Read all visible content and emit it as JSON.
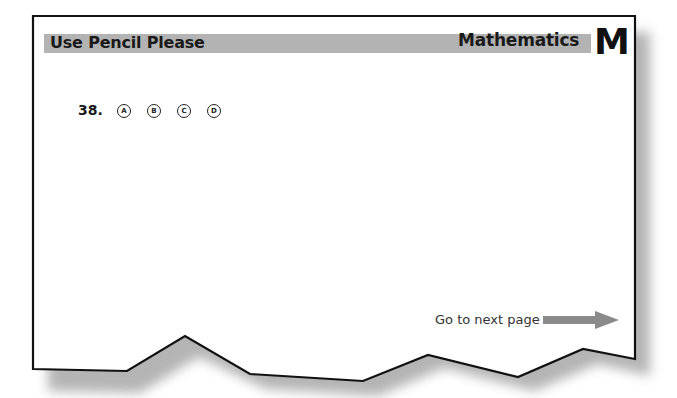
{
  "header": {
    "left_title": "Use Pencil Please",
    "right_title": "Mathematics",
    "section_letter": "M"
  },
  "question": {
    "number": "38.",
    "options": [
      "A",
      "B",
      "C",
      "D"
    ]
  },
  "footer": {
    "next_label": "Go to next page",
    "arrow_icon": "right-arrow-icon"
  },
  "colors": {
    "header_bar": "#b3b3b3",
    "arrow": "#8a8a8a",
    "border": "#111111"
  }
}
